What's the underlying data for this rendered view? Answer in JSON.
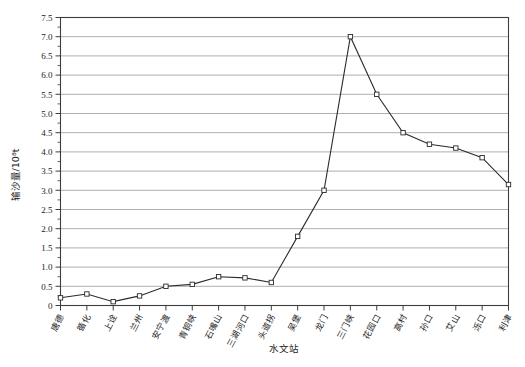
{
  "chart_data": {
    "type": "line",
    "title": "",
    "xlabel": "水文站",
    "ylabel": "输沙量/10⁸t",
    "ylim": [
      0,
      7.5
    ],
    "ytick_step": 0.5,
    "grid": true,
    "legend": "none",
    "marker": "open-square",
    "categories": [
      "唐德",
      "循化",
      "上诠",
      "兰州",
      "安宁渡",
      "青铜峡",
      "石嘴山",
      "三湖河口",
      "头道拐",
      "吴堡",
      "龙门",
      "三门峡",
      "花园口",
      "高村",
      "孙口",
      "艾山",
      "泺口",
      "利津"
    ],
    "values": [
      0.2,
      0.3,
      0.1,
      0.25,
      0.5,
      0.55,
      0.75,
      0.72,
      0.6,
      1.8,
      3.0,
      7.0,
      5.5,
      4.5,
      4.2,
      4.1,
      3.85,
      3.15
    ],
    "ytick_labels": [
      "0",
      "0.5",
      "1.0",
      "1.5",
      "2.0",
      "2.5",
      "3.0",
      "3.5",
      "4.0",
      "4.5",
      "5.0",
      "5.5",
      "6.0",
      "6.5",
      "7.0",
      "7.5"
    ],
    "ytick_values": [
      0,
      0.5,
      1.0,
      1.5,
      2.0,
      2.5,
      3.0,
      3.5,
      4.0,
      4.5,
      5.0,
      5.5,
      6.0,
      6.5,
      7.0,
      7.5
    ]
  },
  "colors": {
    "line": "#2b2b2b",
    "grid": "#9a9a9a",
    "frame": "#3d3d3d",
    "background": "#ffffff",
    "marker_fill": "#ffffff"
  }
}
